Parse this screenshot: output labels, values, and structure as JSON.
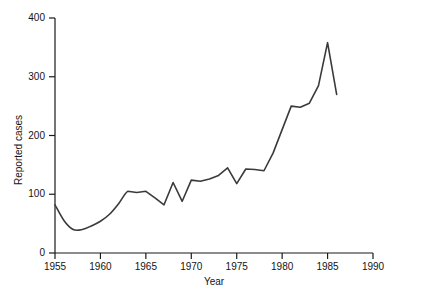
{
  "chart_data": {
    "type": "line",
    "title": "",
    "subtitle": "",
    "xlabel": "Year",
    "ylabel": "Reported cases",
    "xlim": [
      1955,
      1990
    ],
    "ylim": [
      0,
      400
    ],
    "grid": false,
    "legend": null,
    "legend_position": "none",
    "line_color": "#3a3a3a",
    "axis_color": "#1a1a1a",
    "x_ticks": [
      1955,
      1960,
      1965,
      1970,
      1975,
      1980,
      1985,
      1990
    ],
    "x_tick_labels": [
      "1955",
      "1960",
      "1965",
      "1970",
      "1975",
      "1980",
      "1985",
      "1990"
    ],
    "y_ticks": [
      0,
      100,
      200,
      300,
      400
    ],
    "y_tick_labels": [
      "0",
      "100",
      "200",
      "300",
      "400"
    ],
    "x": [
      1955,
      1956,
      1957,
      1958,
      1959,
      1960,
      1961,
      1962,
      1963,
      1964,
      1965,
      1966,
      1967,
      1968,
      1969,
      1970,
      1971,
      1972,
      1973,
      1974,
      1975,
      1976,
      1977,
      1978,
      1979,
      1980,
      1981,
      1982,
      1983,
      1984,
      1985,
      1986
    ],
    "values": [
      82,
      55,
      40,
      40,
      46,
      54,
      66,
      84,
      105,
      103,
      105,
      94,
      82,
      120,
      88,
      124,
      122,
      126,
      132,
      145,
      118,
      143,
      142,
      140,
      170,
      210,
      250,
      248,
      255,
      285,
      358,
      270
    ],
    "series": [
      {
        "name": "Reported cases",
        "values": [
          82,
          55,
          40,
          40,
          46,
          54,
          66,
          84,
          105,
          103,
          105,
          94,
          82,
          120,
          88,
          124,
          122,
          126,
          132,
          145,
          118,
          143,
          142,
          140,
          170,
          210,
          250,
          248,
          255,
          285,
          358,
          270
        ]
      }
    ],
    "annotations": []
  }
}
